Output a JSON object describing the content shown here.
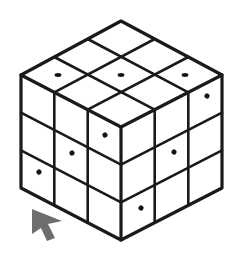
{
  "canvas": {
    "width": 244,
    "height": 254,
    "background_color": "#ffffff"
  },
  "figure": {
    "name": "isometric-rubiks-style-cube",
    "line_color": "#1a1a1a",
    "face_fill_color": "#ffffff",
    "dot_color": "#141414",
    "outer_stroke_width": 3.2,
    "inner_stroke_width": 2.6,
    "divisions": 3
  },
  "geometry": {
    "top_apex": [
      121,
      21
    ],
    "left_vertex": [
      21,
      75
    ],
    "right_vertex": [
      222,
      75
    ],
    "front_center": [
      121,
      127
    ],
    "bottom_vertex": [
      121,
      240
    ],
    "left_bottom": [
      21,
      188
    ],
    "right_bottom": [
      222,
      188
    ],
    "cell_dx": 33.3,
    "cell_dy": 18.0,
    "cell_height": 37.67
  },
  "marks": {
    "top_face": [
      {
        "row": 2,
        "col": 0,
        "cx": 58,
        "cy": 75
      },
      {
        "row": 2,
        "col": 1,
        "cx": 121,
        "cy": 75
      },
      {
        "row": 2,
        "col": 2,
        "cx": 185,
        "cy": 75
      }
    ],
    "left_face": [
      {
        "row": 2,
        "col": 0,
        "cx": 39,
        "cy": 172
      },
      {
        "row": 1,
        "col": 1,
        "cx": 72,
        "cy": 153
      },
      {
        "row": 0,
        "col": 2,
        "cx": 105,
        "cy": 135
      }
    ],
    "right_face": [
      {
        "row": 2,
        "col": 0,
        "cx": 141,
        "cy": 208
      },
      {
        "row": 1,
        "col": 1,
        "cx": 174,
        "cy": 152
      },
      {
        "row": 0,
        "col": 2,
        "cx": 207,
        "cy": 96
      }
    ]
  },
  "cursor": {
    "name": "mouse-pointer",
    "color": "#6e6e6e",
    "tip": [
      32,
      209
    ],
    "points": "32,209 62,221 48,224 55,238 47,241 41,228 32,234"
  }
}
